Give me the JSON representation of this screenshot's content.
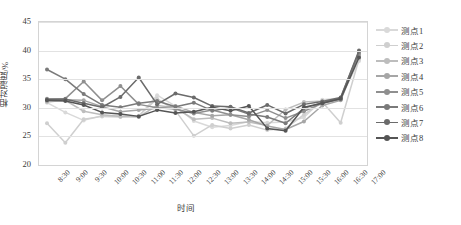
{
  "chart_data": {
    "type": "line",
    "title": "",
    "xlabel": "时间",
    "ylabel": "相对湿度/%",
    "ylim": [
      20,
      45
    ],
    "yticks": [
      20,
      25,
      30,
      35,
      40,
      45
    ],
    "grid": true,
    "legend_position": "right",
    "markers": "circle",
    "categories": [
      "8:30",
      "9:00",
      "9:30",
      "10:00",
      "10:30",
      "11:00",
      "11:30",
      "12:00",
      "12:30",
      "13:00",
      "13:30",
      "14:00",
      "14:30",
      "15:00",
      "15:30",
      "16:00",
      "16:30",
      "17:00"
    ],
    "series": [
      {
        "name": "测点1",
        "color": "#d9d9d9",
        "values": [
          30.9,
          29.2,
          27.8,
          28.6,
          28.7,
          28.5,
          32.2,
          30.3,
          27.7,
          26.6,
          26.9,
          27.6,
          27.4,
          27.5,
          28.3,
          31.4,
          31.7,
          38.2
        ]
      },
      {
        "name": "测点2",
        "color": "#cfcfcf",
        "values": [
          27.3,
          23.9,
          28.0,
          28.5,
          28.4,
          28.6,
          31.6,
          29.5,
          25.1,
          27.0,
          26.4,
          27.0,
          26.1,
          26.4,
          28.8,
          31.0,
          27.4,
          38.5
        ]
      },
      {
        "name": "测点3",
        "color": "#bdbdbd",
        "values": [
          31.0,
          31.3,
          29.4,
          28.8,
          28.5,
          28.4,
          30.4,
          30.0,
          28.0,
          28.2,
          27.3,
          27.5,
          26.9,
          29.7,
          31.0,
          31.2,
          31.6,
          39.0
        ]
      },
      {
        "name": "测点4",
        "color": "#a6a6a6",
        "values": [
          31.2,
          31.4,
          31.3,
          30.2,
          29.3,
          29.6,
          29.9,
          30.3,
          29.2,
          28.6,
          28.8,
          27.9,
          26.8,
          26.2,
          27.6,
          30.4,
          31.3,
          39.2
        ]
      },
      {
        "name": "测点5",
        "color": "#8f8f8f",
        "values": [
          31.6,
          31.6,
          34.6,
          31.3,
          33.8,
          30.6,
          30.0,
          29.8,
          29.0,
          29.6,
          28.8,
          28.5,
          29.6,
          28.2,
          29.4,
          30.8,
          31.5,
          39.5
        ]
      },
      {
        "name": "测点6",
        "color": "#7a7a7a",
        "values": [
          36.7,
          35.0,
          32.4,
          30.5,
          30.1,
          30.8,
          31.2,
          30.2,
          30.9,
          29.5,
          30.0,
          28.9,
          28.4,
          27.3,
          29.9,
          30.9,
          31.7,
          39.8
        ]
      },
      {
        "name": "测点7",
        "color": "#6b6b6b",
        "values": [
          31.4,
          31.5,
          30.8,
          30.1,
          31.9,
          35.3,
          30.6,
          32.5,
          31.8,
          30.3,
          30.2,
          29.1,
          30.5,
          29.0,
          30.6,
          31.1,
          31.8,
          40.0
        ]
      },
      {
        "name": "测点8",
        "color": "#555555",
        "values": [
          31.3,
          31.2,
          30.5,
          29.2,
          28.9,
          28.5,
          29.6,
          29.1,
          29.3,
          30.1,
          29.5,
          30.3,
          26.4,
          26.0,
          30.1,
          30.8,
          31.6,
          38.8
        ]
      }
    ]
  },
  "axes": {
    "y_title": "相对湿度/%",
    "x_title": "时间"
  }
}
